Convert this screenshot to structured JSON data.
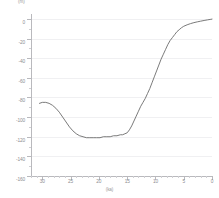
{
  "chart_data": {
    "type": "line",
    "title": "",
    "subtitle": "",
    "xlabel": "(ka)",
    "ylabel": "(m)",
    "x_axis": {
      "ticks": [
        30,
        25,
        20,
        15,
        10,
        5,
        0
      ],
      "tick_labels": [
        "30",
        "25",
        "20",
        "15",
        "10",
        "5",
        "0"
      ],
      "range": [
        32,
        0
      ],
      "reversed": true,
      "minor_tick_interval": 1
    },
    "y_axis": {
      "ticks": [
        0,
        -20,
        -40,
        -60,
        -80,
        -100,
        -120,
        -140,
        -160
      ],
      "tick_labels": [
        "0",
        "-20",
        "-40",
        "-60",
        "-80",
        "-100",
        "-120",
        "-140",
        "-160"
      ],
      "range": [
        -160,
        5
      ],
      "minor_tick_interval": 10
    },
    "grid": {
      "horizontal": true,
      "vertical": false,
      "color": "#f0f0f2"
    },
    "legend": {
      "visible": false,
      "position": "none"
    },
    "line_color": "#6b6b6b",
    "line_width": 0.9,
    "series": [
      {
        "name": "relative sea level",
        "x": [
          30.5,
          30.0,
          29.4,
          28.8,
          28.2,
          27.6,
          27.0,
          26.4,
          25.8,
          25.2,
          24.6,
          24.0,
          23.4,
          22.8,
          22.2,
          21.6,
          21.0,
          20.4,
          19.8,
          19.2,
          18.6,
          18.0,
          17.4,
          16.8,
          16.2,
          15.8,
          15.4,
          15.0,
          14.6,
          14.2,
          13.8,
          13.4,
          13.0,
          12.6,
          12.2,
          11.8,
          11.4,
          11.0,
          10.6,
          10.2,
          9.8,
          9.4,
          9.0,
          8.6,
          8.2,
          7.8,
          7.4,
          7.0,
          6.6,
          6.2,
          5.8,
          5.4,
          5.0,
          4.4,
          3.8,
          3.2,
          2.6,
          2.0,
          1.4,
          0.8,
          0.2,
          0.0
        ],
        "y": [
          -86,
          -85,
          -85,
          -86,
          -88,
          -91,
          -95,
          -100,
          -105,
          -110,
          -114,
          -117,
          -119,
          -120,
          -121,
          -121,
          -121,
          -121,
          -121,
          -120,
          -120,
          -120,
          -119,
          -119,
          -118,
          -118,
          -117,
          -116,
          -113,
          -109,
          -104,
          -99,
          -94,
          -89,
          -85,
          -81,
          -76,
          -71,
          -65,
          -59,
          -53,
          -47,
          -41,
          -36,
          -31,
          -26,
          -22,
          -19,
          -16,
          -13,
          -11,
          -9,
          -7.5,
          -6,
          -4.8,
          -3.8,
          -3.0,
          -2.3,
          -1.6,
          -1.0,
          -0.4,
          -0.2
        ]
      }
    ]
  }
}
